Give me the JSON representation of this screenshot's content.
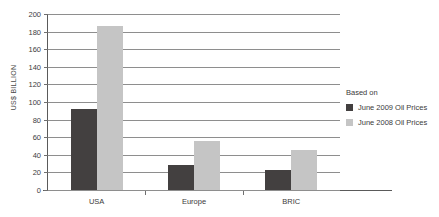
{
  "chart_data": {
    "type": "bar",
    "title": "",
    "subtitle": "",
    "xlabel": "",
    "ylabel": "US$ BILLION",
    "ylim": [
      0,
      200
    ],
    "ytick_step": 20,
    "yticks": [
      200,
      180,
      160,
      140,
      120,
      100,
      80,
      60,
      40,
      20,
      0
    ],
    "categories": [
      "USA",
      "Europe",
      "BRIC"
    ],
    "grid": "horizontal",
    "legend_position": "right",
    "legend_title": "Based on",
    "series": [
      {
        "name": "June 2009 Oil Prices",
        "color": "#434040",
        "values": [
          92,
          28,
          23
        ]
      },
      {
        "name": "June 2008 Oil Prices",
        "color": "#c5c5c5",
        "values": [
          186,
          56,
          46
        ]
      }
    ]
  },
  "colors": {
    "series_dark": "#434040",
    "series_light": "#c5c5c5",
    "gridline": "#8e8e8e",
    "axis": "#5a5a5a",
    "text": "#3a3a3a",
    "background": "#ffffff"
  }
}
